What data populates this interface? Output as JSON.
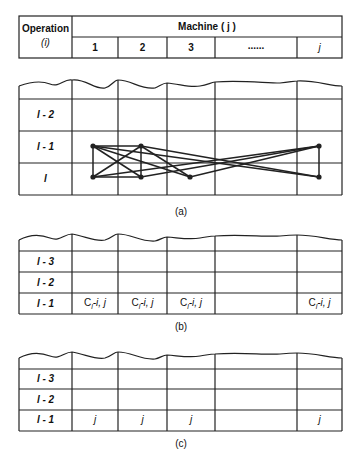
{
  "header": {
    "operation_label": "Operation",
    "operation_var": "(i)",
    "machine_label": "Machine ( j )",
    "columns": [
      "1",
      "2",
      "3",
      "......",
      "j"
    ]
  },
  "panel_a": {
    "rows": [
      "l - 2",
      "l - 1",
      "l"
    ],
    "caption": "(a)",
    "nodes": [
      {
        "col": "1",
        "row": "l - 1"
      },
      {
        "col": "2",
        "row": "l - 1"
      },
      {
        "col": "j",
        "row": "l - 1"
      },
      {
        "col": "1",
        "row": "l"
      },
      {
        "col": "2",
        "row": "l"
      },
      {
        "col": "3",
        "row": "l"
      },
      {
        "col": "j",
        "row": "l"
      }
    ]
  },
  "panel_b": {
    "rows": [
      "l - 3",
      "l - 2",
      "l - 1"
    ],
    "cell_prefix": "C",
    "cell_sub": "l",
    "cell_suffix": "-i, j",
    "caption": "(b)"
  },
  "panel_c": {
    "rows": [
      "l - 3",
      "l - 2",
      "l - 1"
    ],
    "cell_value": "j",
    "caption": "(c)"
  },
  "colors": {
    "line": "#222222",
    "background": "#ffffff"
  }
}
